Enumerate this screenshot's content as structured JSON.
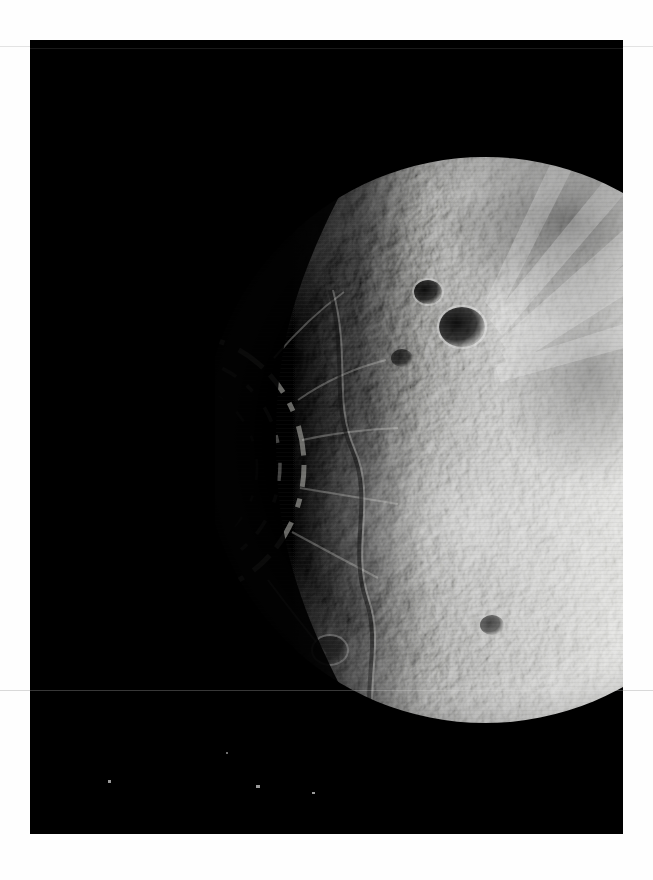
{
  "page": {
    "background_color": "#fefefe",
    "width": 653,
    "height": 880,
    "rules": [
      {
        "name": "top-rule",
        "y": 46,
        "color": "#e3e3e3"
      },
      {
        "name": "bottom-rule",
        "y": 690,
        "color": "#d9d9d9"
      }
    ]
  },
  "photo": {
    "name": "planetary-surface-photograph",
    "frame": {
      "x": 30,
      "y": 40,
      "width": 593,
      "height": 794
    },
    "background_color": "#000000",
    "subject": "cratered planetary body, half-illuminated, terminator running vertically left of center",
    "body": {
      "center_x": 455,
      "center_y": 400,
      "radius": 283,
      "terminator_x": 195,
      "limb_color_bright": "#e8e8e6",
      "limb_color_mid": "#9a9a98",
      "shadow_color": "#000000"
    },
    "features": {
      "basin": {
        "name": "large-dark-impact-basin",
        "center_x": 150,
        "center_y": 425,
        "radius": 118,
        "shade": "#050505"
      },
      "dark_craters": [
        {
          "cx": 398,
          "cy": 252,
          "r": 13,
          "shade": "#2a2a2a"
        },
        {
          "cx": 432,
          "cy": 287,
          "r": 21,
          "shade": "#161616"
        },
        {
          "cx": 372,
          "cy": 318,
          "r": 10,
          "shade": "#3a3a3a"
        },
        {
          "cx": 300,
          "cy": 610,
          "r": 16,
          "shade": "#2e2e2e"
        },
        {
          "cx": 462,
          "cy": 585,
          "r": 11,
          "shade": "#3c3c3c"
        },
        {
          "cx": 262,
          "cy": 318,
          "r": 12,
          "shade": "#333333"
        }
      ],
      "bright_rays": "radial streaks across upper right limb",
      "specks_below_limb": 4
    }
  }
}
